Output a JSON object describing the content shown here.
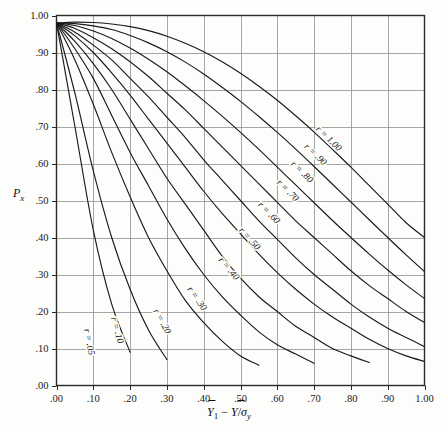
{
  "chart_data": {
    "type": "line",
    "title": "",
    "subtitle": "",
    "xlabel": "Y̅1 − Y̅/σy",
    "ylabel": "Px",
    "xlim": [
      0.0,
      1.0
    ],
    "ylim": [
      0.0,
      1.0
    ],
    "grid": true,
    "legend": "inline-curve-labels",
    "xticks": [
      0.0,
      0.1,
      0.2,
      0.3,
      0.4,
      0.5,
      0.6,
      0.7,
      0.8,
      0.9,
      1.0
    ],
    "xtick_labels": [
      ".00",
      ".10",
      ".20",
      ".30",
      ".40",
      ".50",
      ".60",
      ".70",
      ".80",
      ".90",
      "1.00"
    ],
    "yticks": [
      0.0,
      0.1,
      0.2,
      0.3,
      0.4,
      0.5,
      0.6,
      0.7,
      0.8,
      0.9,
      1.0
    ],
    "ytick_labels": [
      ".00",
      ".10",
      ".20",
      ".30",
      ".40",
      ".50",
      ".60",
      ".70",
      ".80",
      ".90",
      "1.00"
    ],
    "x": [
      0.0,
      0.05,
      0.1,
      0.15,
      0.2,
      0.25,
      0.3,
      0.35,
      0.4,
      0.45,
      0.5,
      0.55,
      0.6,
      0.65,
      0.7,
      0.75,
      0.8,
      0.85,
      0.9,
      0.95,
      1.0
    ],
    "series": [
      {
        "name": "r = .05",
        "label": "r = .05",
        "label_x": 0.072,
        "label_y": 0.115,
        "values": [
          0.98,
          0.7,
          0.42,
          0.22,
          0.09,
          null,
          null,
          null,
          null,
          null,
          null,
          null,
          null,
          null,
          null,
          null,
          null,
          null,
          null,
          null,
          null
        ]
      },
      {
        "name": "r = .10",
        "label": "r = .10",
        "label_x": 0.148,
        "label_y": 0.145,
        "values": [
          0.98,
          0.79,
          0.58,
          0.4,
          0.26,
          0.15,
          0.07,
          null,
          null,
          null,
          null,
          null,
          null,
          null,
          null,
          null,
          null,
          null,
          null,
          null,
          null
        ]
      },
      {
        "name": "r = .20",
        "label": "r = .20",
        "label_x": 0.272,
        "label_y": 0.165,
        "values": [
          0.98,
          0.88,
          0.76,
          0.63,
          0.51,
          0.4,
          0.31,
          0.23,
          0.17,
          0.12,
          0.08,
          0.055,
          null,
          null,
          null,
          null,
          null,
          null,
          null,
          null,
          null
        ]
      },
      {
        "name": "r = .30",
        "label": "r = .30",
        "label_x": 0.368,
        "label_y": 0.225,
        "values": [
          0.98,
          0.91,
          0.83,
          0.73,
          0.63,
          0.54,
          0.45,
          0.37,
          0.3,
          0.24,
          0.19,
          0.145,
          0.11,
          0.085,
          0.06,
          null,
          null,
          null,
          null,
          null,
          null
        ]
      },
      {
        "name": "r = .40",
        "label": "r = .40",
        "label_x": 0.455,
        "label_y": 0.305,
        "values": [
          0.98,
          0.93,
          0.87,
          0.8,
          0.72,
          0.64,
          0.56,
          0.49,
          0.42,
          0.35,
          0.29,
          0.24,
          0.2,
          0.16,
          0.13,
          0.1,
          0.08,
          0.062,
          null,
          null,
          null
        ]
      },
      {
        "name": "r = .50",
        "label": "r = .50",
        "label_x": 0.512,
        "label_y": 0.385,
        "values": [
          0.98,
          0.945,
          0.9,
          0.845,
          0.785,
          0.72,
          0.655,
          0.59,
          0.525,
          0.465,
          0.41,
          0.355,
          0.305,
          0.26,
          0.22,
          0.185,
          0.155,
          0.125,
          0.1,
          0.08,
          0.065
        ]
      },
      {
        "name": "r = .60",
        "label": "r = .60",
        "label_x": 0.565,
        "label_y": 0.455,
        "values": [
          0.98,
          0.955,
          0.92,
          0.88,
          0.83,
          0.78,
          0.725,
          0.67,
          0.61,
          0.555,
          0.5,
          0.445,
          0.395,
          0.345,
          0.3,
          0.26,
          0.22,
          0.185,
          0.155,
          0.13,
          0.105
        ]
      },
      {
        "name": "r = .70",
        "label": "r = .70",
        "label_x": 0.616,
        "label_y": 0.515,
        "values": [
          0.98,
          0.965,
          0.94,
          0.91,
          0.875,
          0.835,
          0.79,
          0.745,
          0.695,
          0.645,
          0.595,
          0.545,
          0.495,
          0.445,
          0.4,
          0.355,
          0.31,
          0.27,
          0.235,
          0.2,
          0.17
        ]
      },
      {
        "name": "r = .80",
        "label": "r = .80",
        "label_x": 0.655,
        "label_y": 0.565,
        "values": [
          0.98,
          0.973,
          0.958,
          0.938,
          0.912,
          0.882,
          0.848,
          0.81,
          0.77,
          0.728,
          0.684,
          0.638,
          0.59,
          0.542,
          0.494,
          0.446,
          0.4,
          0.355,
          0.312,
          0.272,
          0.235
        ]
      },
      {
        "name": "r = .90",
        "label": "r = .90",
        "label_x": 0.692,
        "label_y": 0.612,
        "values": [
          0.98,
          0.978,
          0.972,
          0.962,
          0.946,
          0.926,
          0.902,
          0.874,
          0.842,
          0.806,
          0.768,
          0.727,
          0.684,
          0.639,
          0.592,
          0.544,
          0.496,
          0.448,
          0.4,
          0.353,
          0.308
        ]
      },
      {
        "name": "r = 1.00",
        "label": "r = 1.00",
        "label_x": 0.728,
        "label_y": 0.655,
        "values": [
          0.98,
          0.982,
          0.981,
          0.977,
          0.97,
          0.959,
          0.944,
          0.925,
          0.902,
          0.875,
          0.844,
          0.809,
          0.771,
          0.729,
          0.685,
          0.638,
          0.59,
          0.54,
          0.49,
          0.44,
          0.4
        ]
      }
    ],
    "colors": {
      "curve": "#1a1a1a",
      "grid": "#8f8f8f",
      "frame": "#2a2a2a",
      "background": "#fdfdfb",
      "text": "#101010"
    }
  },
  "axes": {
    "y_title": "Px",
    "x_title_parts": {
      "y_bar_sub": "Y̅1",
      "minus": "−",
      "y_bar": "Y̅",
      "slash": "/",
      "sigma_y": "σy"
    }
  }
}
